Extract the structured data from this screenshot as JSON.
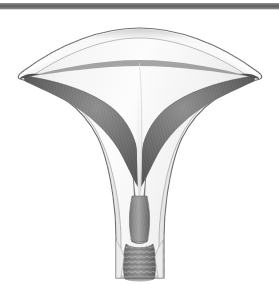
{
  "page": {
    "background_color": "#ffffff",
    "width": 279,
    "height": 285,
    "figure_title": "Uterus — coronal section",
    "watermark_text": "·"
  },
  "top_rule": {
    "name": "horizontal-rule",
    "color": "#6e6e6e",
    "thickness_px": 6
  },
  "illustration": {
    "type": "anatomical-line-art",
    "subject": "uterus-coronal-cross-section",
    "style": "grayscale-shaded",
    "palette": {
      "outline": "#5a5a5a",
      "serosa_light": "#f2f2f2",
      "myometrium_light": "#e8e8e8",
      "myometrium_mid": "#d2d2d2",
      "endometrium_dark": "#5d5d5d",
      "cavity_darkest": "#4a4a4a",
      "cavity_line": "#efefef",
      "cervix_mid": "#8a8a8a",
      "cervix_dark": "#6a6a6a",
      "background": "#ffffff"
    },
    "parts": [
      {
        "id": "fundus",
        "label": "Fundus of uterus"
      },
      {
        "id": "left-cornu",
        "label": "Left cornu"
      },
      {
        "id": "right-cornu",
        "label": "Right cornu"
      },
      {
        "id": "myometrium",
        "label": "Myometrium (uterine wall)"
      },
      {
        "id": "endometrium",
        "label": "Endometrium"
      },
      {
        "id": "uterine-cavity",
        "label": "Uterine cavity"
      },
      {
        "id": "internal-os",
        "label": "Internal os"
      },
      {
        "id": "cervical-canal",
        "label": "Cervical canal"
      },
      {
        "id": "cervix",
        "label": "Cervix"
      },
      {
        "id": "external-os",
        "label": "External os"
      },
      {
        "id": "vaginal-rugae",
        "label": "Rugae"
      }
    ]
  }
}
